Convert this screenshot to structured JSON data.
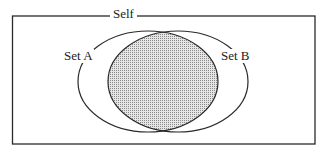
{
  "diagram": {
    "type": "venn",
    "universe_label": "Self",
    "sets": [
      {
        "name": "Set A",
        "label": "Set A"
      },
      {
        "name": "Set B",
        "label": "Set B"
      }
    ],
    "intersection": {
      "shaded": true,
      "fill": "#cfcfcf"
    },
    "colors": {
      "stroke": "#2a2a2a",
      "background": "#ffffff",
      "shade": "#c8c8c8"
    }
  }
}
